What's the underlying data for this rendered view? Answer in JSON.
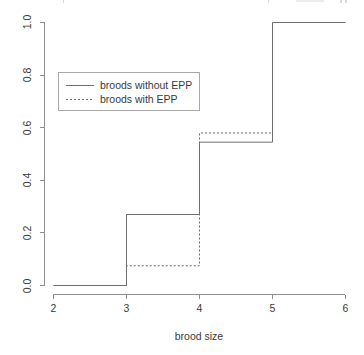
{
  "chart_data": {
    "type": "line",
    "subtype": "ecdf-step",
    "title": "",
    "xlabel": "brood size",
    "ylabel": "",
    "xlim": [
      2,
      6
    ],
    "ylim": [
      0.0,
      1.0
    ],
    "xticks": [
      2,
      3,
      4,
      5,
      6
    ],
    "xtick_labels": [
      "2",
      "3",
      "4",
      "5",
      "6"
    ],
    "yticks": [
      0.0,
      0.2,
      0.4,
      0.6,
      0.8,
      1.0
    ],
    "ytick_labels": [
      "0.0",
      "0.2",
      "0.4",
      "0.6",
      "0.8",
      "1.0"
    ],
    "grid": false,
    "legend_position": "upper left",
    "series": [
      {
        "name": "broods without EPP",
        "style": "solid",
        "color": "#6f6f6f",
        "x": [
          2,
          3,
          4,
          5,
          6
        ],
        "values": [
          0.0,
          0.27,
          0.545,
          1.0,
          1.0
        ],
        "steps": [
          {
            "x_from": 2,
            "x_to": 3,
            "y": 0.0
          },
          {
            "x_from": 3,
            "x_to": 4,
            "y": 0.27
          },
          {
            "x_from": 4,
            "x_to": 5,
            "y": 0.545
          },
          {
            "x_from": 5,
            "x_to": 6,
            "y": 1.0
          }
        ]
      },
      {
        "name": "broods with EPP",
        "style": "dotted",
        "color": "#6f6f6f",
        "x": [
          2,
          3,
          4,
          5,
          6
        ],
        "values": [
          0.0,
          0.075,
          0.58,
          1.0,
          1.0
        ],
        "steps": [
          {
            "x_from": 2,
            "x_to": 3,
            "y": 0.0
          },
          {
            "x_from": 3,
            "x_to": 4,
            "y": 0.075
          },
          {
            "x_from": 4,
            "x_to": 5,
            "y": 0.58
          },
          {
            "x_from": 5,
            "x_to": 6,
            "y": 1.0
          }
        ]
      }
    ]
  },
  "axes": {
    "x_title": "brood size",
    "x_tick_2": "2",
    "x_tick_3": "3",
    "x_tick_4": "4",
    "x_tick_5": "5",
    "x_tick_6": "6",
    "y_tick_00": "0.0",
    "y_tick_02": "0.2",
    "y_tick_04": "0.4",
    "y_tick_06": "0.6",
    "y_tick_08": "0.8",
    "y_tick_10": "1.0"
  },
  "legend": {
    "entry_solid": "broods without EPP",
    "entry_dotted": "broods with EPP"
  },
  "colors": {
    "line": "#6f6f6f",
    "axis": "#8e8e8e",
    "text": "#3a3a3a",
    "background": "#ffffff",
    "legend_border": "#a8a8a8"
  }
}
